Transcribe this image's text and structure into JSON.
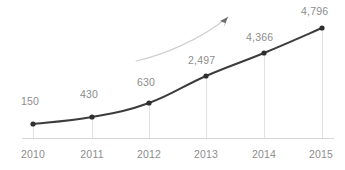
{
  "chart_data": {
    "type": "line",
    "title": "",
    "subtitle": "",
    "xlabel": "",
    "ylabel": "",
    "categories": [
      "2010",
      "2011",
      "2012",
      "2013",
      "2014",
      "2015"
    ],
    "values": [
      150,
      430,
      630,
      2497,
      4366,
      4796
    ],
    "value_labels": [
      "150",
      "430",
      "630",
      "2,497",
      "4,366",
      "4,796"
    ],
    "series": [
      {
        "name": "",
        "values": [
          150,
          430,
          630,
          2497,
          4366,
          4796
        ]
      }
    ],
    "ylim": [
      0,
      5000
    ],
    "grid": "vertical-stubs-only",
    "legend": "none",
    "annotations": [
      {
        "name": "upward-trend-arrow",
        "kind": "curved-arrow",
        "description": "light gray curved arrow sweeping up to the right"
      }
    ],
    "colors": {
      "line": "#3c3c3c",
      "marker": "#2f2f2f",
      "gridline": "#e2e2e2",
      "axis": "#d8d8d8",
      "label_text": "#8d8d8d",
      "annotation_arrow": "#cfcfcf",
      "background": "#ffffff"
    }
  },
  "points": [
    {
      "x": 33,
      "y": 124,
      "label": "150",
      "label_x": 21,
      "label_y": 95,
      "tick": "2010",
      "tick_x": 13,
      "tick_y": 148
    },
    {
      "x": 92,
      "y": 117,
      "label": "430",
      "label_x": 80,
      "label_y": 88,
      "tick": "2011",
      "tick_x": 72,
      "tick_y": 148
    },
    {
      "x": 149,
      "y": 103,
      "label": "630",
      "label_x": 137,
      "label_y": 76,
      "tick": "2012",
      "tick_x": 129,
      "tick_y": 148
    },
    {
      "x": 206,
      "y": 76,
      "label": "2,497",
      "label_x": 188,
      "label_y": 54,
      "tick": "2013",
      "tick_x": 186,
      "tick_y": 148
    },
    {
      "x": 264,
      "y": 53,
      "label": "4,366",
      "label_x": 246,
      "label_y": 31,
      "tick": "2014",
      "tick_x": 244,
      "tick_y": 148
    },
    {
      "x": 322,
      "y": 28,
      "label": "4,796",
      "label_x": 301,
      "label_y": 5,
      "tick": "2015",
      "tick_x": 301,
      "tick_y": 148
    }
  ],
  "axis": {
    "baseline_y": 138,
    "baseline_x1": 22,
    "baseline_x2": 334
  },
  "annotation_arrow": {
    "path": "M 136 61 C 163 55, 200 40, 228 17",
    "head": "M 228 17 L 220 21 L 225 23 L 224 27 Z"
  }
}
